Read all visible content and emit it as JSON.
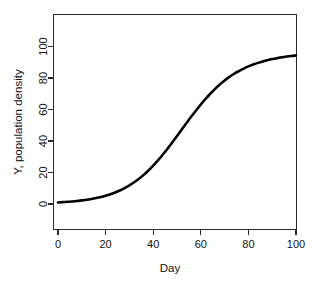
{
  "chart_data": {
    "type": "line",
    "title": "",
    "xlabel": "Day",
    "ylabel": "Y, population density",
    "xlim": [
      0,
      100
    ],
    "ylim": [
      0,
      110
    ],
    "grid": false,
    "legend": false,
    "xticks": [
      0,
      20,
      40,
      60,
      80,
      100
    ],
    "yticks": [
      0,
      20,
      40,
      60,
      80,
      100
    ],
    "xtick_labels": [
      "0",
      "20",
      "40",
      "60",
      "80",
      "100"
    ],
    "ytick_labels": [
      "0",
      "20",
      "40",
      "60",
      "80",
      "100"
    ],
    "series": [
      {
        "name": "logistic growth",
        "color": "#000000",
        "line_width": 2.6,
        "x": [
          0,
          2,
          4,
          6,
          8,
          10,
          12,
          14,
          16,
          18,
          20,
          22,
          24,
          26,
          28,
          30,
          32,
          34,
          36,
          38,
          40,
          42,
          44,
          46,
          48,
          50,
          52,
          54,
          56,
          58,
          60,
          62,
          64,
          66,
          68,
          70,
          72,
          74,
          76,
          78,
          80,
          82,
          84,
          86,
          88,
          90,
          92,
          94,
          96,
          98,
          100
        ],
        "y": [
          1.0,
          1.2,
          1.4,
          1.6,
          1.9,
          2.3,
          2.7,
          3.2,
          3.8,
          4.5,
          5.3,
          6.2,
          7.3,
          8.6,
          10.1,
          11.8,
          13.8,
          16.0,
          18.5,
          21.3,
          24.4,
          27.7,
          31.3,
          35.1,
          39.1,
          43.2,
          47.3,
          51.4,
          55.5,
          59.4,
          63.2,
          66.7,
          70.0,
          73.1,
          75.9,
          78.4,
          80.7,
          82.7,
          84.4,
          86.0,
          87.4,
          88.6,
          89.6,
          90.5,
          91.3,
          92.0,
          92.6,
          93.1,
          93.6,
          94.0,
          94.3
        ]
      }
    ],
    "model": {
      "description": "logistic growth curve",
      "carrying_capacity": 97,
      "midpoint_day": 58,
      "growth_rate": 0.085,
      "initial_value": 1.0
    }
  },
  "axes": {
    "x_axis_name": "Day",
    "y_axis_name": "Y, population density"
  }
}
